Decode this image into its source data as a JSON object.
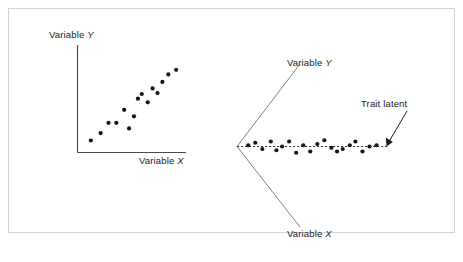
{
  "figure": {
    "background_color": "#ffffff",
    "frame_color": "#d2d2d2",
    "point_color": "#151515",
    "axis_color": "#4a4a4a",
    "rotated_axis_color": "#707070"
  },
  "left_panel": {
    "y_axis_label_prefix": "Variable ",
    "y_axis_label_var": "Y",
    "x_axis_label_prefix": "Variable ",
    "x_axis_label_var": "X"
  },
  "right_panel": {
    "y_axis_label_prefix": "Variable ",
    "y_axis_label_var": "Y",
    "x_axis_label_prefix": "Variable ",
    "x_axis_label_var": "X",
    "annotation_label": "Trait latent"
  },
  "chart_data": [
    {
      "type": "scatter",
      "title": "",
      "xlabel": "Variable X",
      "ylabel": "Variable Y",
      "grid": false,
      "legend": "none",
      "axes_style": "orthogonal-L",
      "description": "Positive linear association between Variable X and Variable Y",
      "xlim": [
        0,
        100
      ],
      "ylim": [
        0,
        100
      ],
      "points": [
        {
          "x": 7,
          "y": 7
        },
        {
          "x": 17,
          "y": 15
        },
        {
          "x": 25,
          "y": 26
        },
        {
          "x": 33,
          "y": 26
        },
        {
          "x": 41,
          "y": 40
        },
        {
          "x": 46,
          "y": 20
        },
        {
          "x": 51,
          "y": 33
        },
        {
          "x": 55,
          "y": 52
        },
        {
          "x": 59,
          "y": 57
        },
        {
          "x": 65,
          "y": 48
        },
        {
          "x": 70,
          "y": 63
        },
        {
          "x": 75,
          "y": 58
        },
        {
          "x": 80,
          "y": 70
        },
        {
          "x": 86,
          "y": 78
        },
        {
          "x": 94,
          "y": 83
        }
      ]
    },
    {
      "type": "scatter",
      "title": "",
      "xlabel": "Variable X",
      "ylabel": "Variable Y",
      "grid": false,
      "legend": "none",
      "axes_style": "rotated-V",
      "description": "Same cloud rotated onto the latent trait axis: points lie along a horizontal dashed line (the latent trait), with small residual spread",
      "annotations": [
        {
          "text": "Trait latent",
          "points_to": "right end of dashed latent axis"
        }
      ],
      "latent_axis": {
        "orientation": "horizontal",
        "style": "dashed"
      },
      "points": [
        {
          "t": 3,
          "r": 1
        },
        {
          "t": 8,
          "r": 3
        },
        {
          "t": 13,
          "r": -2
        },
        {
          "t": 19,
          "r": 4
        },
        {
          "t": 23,
          "r": -3
        },
        {
          "t": 27,
          "r": 0
        },
        {
          "t": 32,
          "r": 4
        },
        {
          "t": 37,
          "r": -5
        },
        {
          "t": 42,
          "r": 1
        },
        {
          "t": 47,
          "r": -4
        },
        {
          "t": 52,
          "r": 2
        },
        {
          "t": 57,
          "r": 5
        },
        {
          "t": 62,
          "r": -1
        },
        {
          "t": 66,
          "r": -4
        },
        {
          "t": 70,
          "r": -2
        },
        {
          "t": 75,
          "r": 1
        },
        {
          "t": 79,
          "r": 4
        },
        {
          "t": 84,
          "r": -4
        },
        {
          "t": 89,
          "r": 0
        },
        {
          "t": 94,
          "r": 1
        }
      ]
    }
  ]
}
